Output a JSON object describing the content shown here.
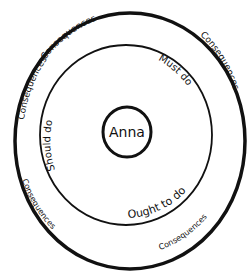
{
  "diagram": {
    "center_label": "Anna",
    "inner_ring_labels": {
      "top_right": "Must do",
      "left": "Should do",
      "bottom_right": "Ought to do"
    },
    "outer_ring_labels": {
      "top": "Consequences",
      "right": "Consequences",
      "left": "Consequences",
      "bottom_left": "Consequences",
      "bottom_right": "Consequences"
    }
  }
}
